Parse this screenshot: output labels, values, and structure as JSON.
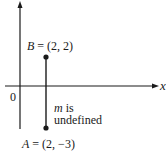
{
  "diagram": {
    "axes": {
      "x_label": "x",
      "origin_label": "0"
    },
    "points": [
      {
        "name": "B",
        "x": 2,
        "y": 2,
        "label_var": "B",
        "label_eq": " = (2, 2)"
      },
      {
        "name": "A",
        "x": 2,
        "y": -3,
        "label_var": "A",
        "label_eq": " = (2, −3)"
      }
    ],
    "annotation": {
      "slope_var": "m",
      "line1_rest": " is",
      "line2": "undefined"
    },
    "colors": {
      "ink": "#1a1a1a",
      "background": "#ffffff"
    }
  }
}
